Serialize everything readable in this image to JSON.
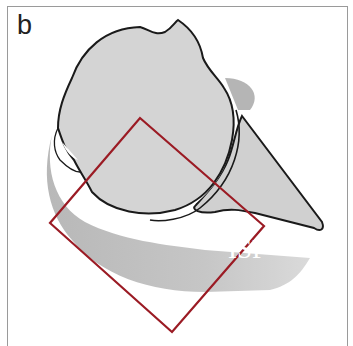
{
  "figure": {
    "panel_label": "b",
    "structure_label": "ISP",
    "colors": {
      "bone_fill": "#d2d2d2",
      "muscle_fill": "#bdbdbd",
      "outline": "#1a1a1a",
      "roi_square": "#9b1b24",
      "frame": "#9a9a9a"
    },
    "roi_square_vertices": [
      [
        140,
        118
      ],
      [
        264,
        226
      ],
      [
        172,
        332
      ],
      [
        50,
        223
      ]
    ]
  }
}
